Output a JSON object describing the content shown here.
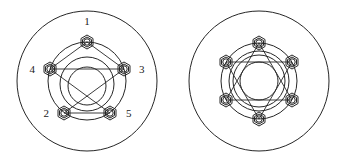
{
  "diagram": {
    "background_color": "#ffffff",
    "stroke_color": "#262626",
    "label_color": "#1a1a1a",
    "figures": [
      {
        "id": "left-figure",
        "name": "five-bolt-flange",
        "pattern": "pentagram",
        "bolt_count": 5,
        "outer_circle": {
          "cx": 87,
          "cy": 81,
          "r": 70
        },
        "bolt_circle": {
          "cx": 87,
          "cy": 81,
          "r": 39
        },
        "inner_circles": [
          {
            "cx": 87,
            "cy": 84,
            "r": 27
          },
          {
            "cx": 87,
            "cy": 86,
            "r": 19
          }
        ],
        "bolt_radius_outer": 7.0,
        "bolt_radius_inner": 3.2,
        "bolts": [
          {
            "label": "1",
            "angle_deg": -90,
            "cx": 87,
            "cy": 42,
            "label_x": 87,
            "label_y": 25,
            "label_anchor": "middle"
          },
          {
            "label": "3",
            "angle_deg": -18,
            "cx": 124,
            "cy": 69,
            "label_x": 139,
            "label_y": 73,
            "label_anchor": "start"
          },
          {
            "label": "5",
            "angle_deg": 54,
            "cx": 110,
            "cy": 113,
            "label_x": 126,
            "label_y": 117,
            "label_anchor": "start"
          },
          {
            "label": "2",
            "angle_deg": 126,
            "cx": 64,
            "cy": 113,
            "label_x": 49,
            "label_y": 117,
            "label_anchor": "end"
          },
          {
            "label": "4",
            "angle_deg": -162,
            "cx": 50,
            "cy": 69,
            "label_x": 35,
            "label_y": 73,
            "label_anchor": "end"
          }
        ],
        "star_path_order": [
          "1",
          "3",
          "2",
          "5",
          "4",
          "1"
        ],
        "labels": [
          "1",
          "2",
          "3",
          "4",
          "5"
        ]
      },
      {
        "id": "right-figure",
        "name": "six-bolt-flange",
        "pattern": "hexagram",
        "bolt_count": 6,
        "outer_circle": {
          "cx": 259,
          "cy": 81,
          "r": 70
        },
        "bolt_circle": {
          "cx": 259,
          "cy": 81,
          "r": 38
        },
        "inner_circles": [
          {
            "cx": 259,
            "cy": 81,
            "r": 30
          },
          {
            "cx": 259,
            "cy": 81,
            "r": 26
          },
          {
            "cx": 259,
            "cy": 81,
            "r": 19
          }
        ],
        "bolt_radius_outer": 7.0,
        "bolt_radius_inner": 3.2,
        "bolts": [
          {
            "angle_deg": -90,
            "cx": 259,
            "cy": 43
          },
          {
            "angle_deg": -30,
            "cx": 292,
            "cy": 62
          },
          {
            "angle_deg": 30,
            "cx": 292,
            "cy": 100
          },
          {
            "angle_deg": 90,
            "cx": 259,
            "cy": 119
          },
          {
            "angle_deg": 150,
            "cx": 226,
            "cy": 100
          },
          {
            "angle_deg": -150,
            "cx": 226,
            "cy": 62
          }
        ],
        "triangle_a": [
          [
            259,
            43
          ],
          [
            292,
            100
          ],
          [
            226,
            100
          ]
        ],
        "triangle_b": [
          [
            259,
            119
          ],
          [
            226,
            62
          ],
          [
            292,
            62
          ]
        ],
        "labels": []
      }
    ]
  }
}
